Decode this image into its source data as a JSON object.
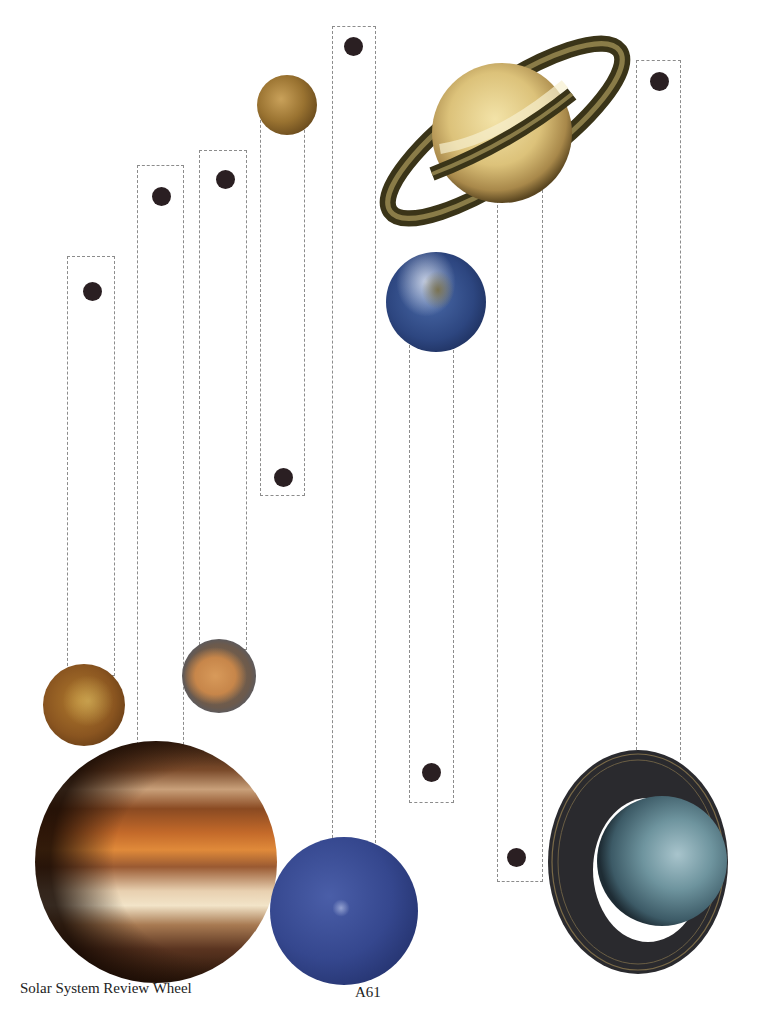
{
  "page": {
    "title": "Solar System Review Wheel",
    "page_number": "A61"
  },
  "strips": [
    {
      "id": "strip-1",
      "x": 67,
      "y": 256,
      "w": 48,
      "h": 420,
      "dot": {
        "x": 92,
        "y": 291
      },
      "planet": "Venus"
    },
    {
      "id": "strip-2",
      "x": 137,
      "y": 165,
      "w": 47,
      "h": 590,
      "dot": {
        "x": 161,
        "y": 196
      },
      "planet": "Jupiter"
    },
    {
      "id": "strip-3",
      "x": 199,
      "y": 150,
      "w": 48,
      "h": 500,
      "dot": {
        "x": 225,
        "y": 179
      },
      "planet": "Mars"
    },
    {
      "id": "strip-4",
      "x": 260,
      "y": 100,
      "w": 45,
      "h": 396,
      "dot": {
        "x": 283,
        "y": 477
      },
      "planet": "Mercury"
    },
    {
      "id": "strip-5",
      "x": 332,
      "y": 26,
      "w": 44,
      "h": 822,
      "dot": {
        "x": 353,
        "y": 46
      },
      "planet": "Neptune"
    },
    {
      "id": "strip-6",
      "x": 409,
      "y": 330,
      "w": 45,
      "h": 473,
      "dot": {
        "x": 431,
        "y": 772
      },
      "planet": "Earth"
    },
    {
      "id": "strip-7",
      "x": 497,
      "y": 190,
      "w": 46,
      "h": 692,
      "dot": {
        "x": 516,
        "y": 857
      },
      "planet": "Saturn"
    },
    {
      "id": "strip-8",
      "x": 636,
      "y": 60,
      "w": 45,
      "h": 700,
      "dot": {
        "x": 659,
        "y": 81
      },
      "planet": "Uranus"
    }
  ],
  "planets": [
    {
      "name": "Mercury",
      "cx": 287,
      "cy": 105,
      "r": 30
    },
    {
      "name": "Venus",
      "cx": 84,
      "cy": 705,
      "r": 41
    },
    {
      "name": "Earth",
      "cx": 436,
      "cy": 302,
      "r": 50
    },
    {
      "name": "Mars",
      "cx": 219,
      "cy": 676,
      "r": 37
    },
    {
      "name": "Jupiter",
      "cx": 156,
      "cy": 862,
      "r": 121
    },
    {
      "name": "Saturn",
      "cx": 502,
      "cy": 133,
      "r": 70
    },
    {
      "name": "Uranus",
      "cx": 640,
      "cy": 862,
      "r": 96
    },
    {
      "name": "Neptune",
      "cx": 344,
      "cy": 911,
      "r": 74
    }
  ],
  "colors": {
    "dashed_border": "#8c8c8c",
    "dot": "#2a1f22",
    "text": "#222222"
  }
}
